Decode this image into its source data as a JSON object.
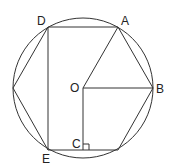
{
  "diagram": {
    "labels": {
      "A": "A",
      "B": "B",
      "C": "C",
      "D": "D",
      "E": "E",
      "O": "O"
    },
    "colors": {
      "stroke": "#333333",
      "background": "#ffffff"
    }
  }
}
